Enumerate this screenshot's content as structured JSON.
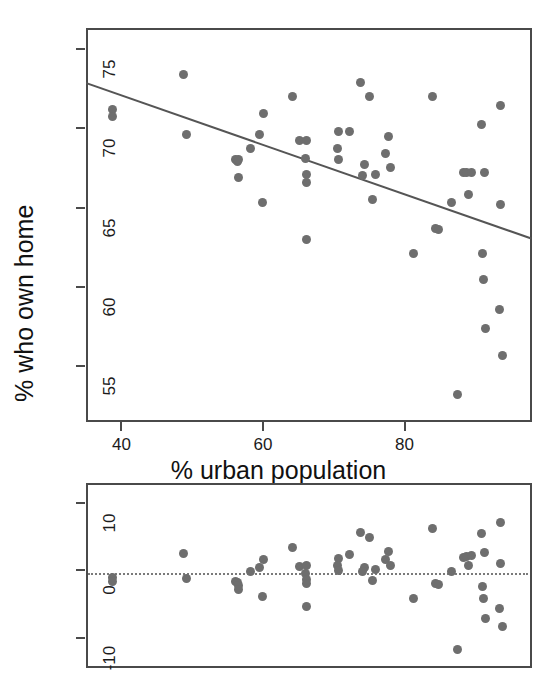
{
  "figure": {
    "width": 557,
    "height": 687,
    "background": "#ffffff",
    "point_color": "#6e6e6e",
    "line_color": "#555555",
    "frame_color": "#4a4a4a"
  },
  "chart_data": [
    {
      "type": "scatter",
      "id": "scatter-regression",
      "title": "",
      "xlabel": "% urban population",
      "ylabel": "% who own home",
      "xlim": [
        35.0,
        98.0
      ],
      "ylim": [
        51.5,
        76.3
      ],
      "xticks": [
        40,
        60,
        80
      ],
      "xticklabels": [
        "40",
        "60",
        "80"
      ],
      "yticks": [
        55,
        60,
        65,
        70,
        75
      ],
      "yticklabels": [
        "55",
        "60",
        "65",
        "70",
        "75"
      ],
      "grid": false,
      "legend": false,
      "fit_line": {
        "label": "least-squares regression line",
        "x_start": 35.0,
        "y_start": 72.9,
        "x_end": 98.0,
        "y_end": 63.1,
        "slope": -0.1556,
        "intercept": 78.35
      },
      "points": [
        {
          "x": 38.8,
          "y": 71.2
        },
        {
          "x": 38.8,
          "y": 70.7
        },
        {
          "x": 48.8,
          "y": 73.4
        },
        {
          "x": 49.2,
          "y": 69.6
        },
        {
          "x": 56.1,
          "y": 68.0
        },
        {
          "x": 56.4,
          "y": 67.9
        },
        {
          "x": 56.6,
          "y": 68.0
        },
        {
          "x": 56.5,
          "y": 66.9
        },
        {
          "x": 58.3,
          "y": 68.7
        },
        {
          "x": 59.5,
          "y": 69.6
        },
        {
          "x": 60.1,
          "y": 70.9
        },
        {
          "x": 60.0,
          "y": 65.3
        },
        {
          "x": 64.1,
          "y": 72.0
        },
        {
          "x": 65.1,
          "y": 69.2
        },
        {
          "x": 66.1,
          "y": 69.2
        },
        {
          "x": 66.0,
          "y": 68.1
        },
        {
          "x": 66.2,
          "y": 67.1
        },
        {
          "x": 66.1,
          "y": 66.6
        },
        {
          "x": 66.1,
          "y": 63.0
        },
        {
          "x": 70.6,
          "y": 69.8
        },
        {
          "x": 70.5,
          "y": 68.7
        },
        {
          "x": 70.7,
          "y": 68.0
        },
        {
          "x": 72.2,
          "y": 69.8
        },
        {
          "x": 73.8,
          "y": 72.9
        },
        {
          "x": 74.4,
          "y": 67.7
        },
        {
          "x": 74.0,
          "y": 67.0
        },
        {
          "x": 75.0,
          "y": 72.0
        },
        {
          "x": 75.5,
          "y": 65.5
        },
        {
          "x": 75.9,
          "y": 67.1
        },
        {
          "x": 77.7,
          "y": 69.5
        },
        {
          "x": 77.3,
          "y": 68.4
        },
        {
          "x": 78.0,
          "y": 67.5
        },
        {
          "x": 81.2,
          "y": 62.1
        },
        {
          "x": 84.0,
          "y": 72.0
        },
        {
          "x": 84.4,
          "y": 63.7
        },
        {
          "x": 84.8,
          "y": 63.6
        },
        {
          "x": 86.6,
          "y": 65.3
        },
        {
          "x": 87.5,
          "y": 53.2
        },
        {
          "x": 88.3,
          "y": 67.2
        },
        {
          "x": 88.7,
          "y": 67.2
        },
        {
          "x": 89.4,
          "y": 67.2
        },
        {
          "x": 89.0,
          "y": 65.8
        },
        {
          "x": 90.9,
          "y": 70.2
        },
        {
          "x": 91.3,
          "y": 67.2
        },
        {
          "x": 91.0,
          "y": 62.1
        },
        {
          "x": 91.2,
          "y": 60.5
        },
        {
          "x": 91.5,
          "y": 57.4
        },
        {
          "x": 93.5,
          "y": 71.4
        },
        {
          "x": 93.6,
          "y": 65.2
        },
        {
          "x": 93.4,
          "y": 58.6
        },
        {
          "x": 93.8,
          "y": 55.7
        }
      ]
    },
    {
      "type": "scatter",
      "id": "residual-plot",
      "title": "",
      "xlabel": "",
      "ylabel": "",
      "xlim": [
        35.0,
        98.0
      ],
      "ylim": [
        -14.5,
        13.0
      ],
      "xticks": [],
      "xticklabels": [],
      "yticks": [
        -10,
        0,
        10
      ],
      "yticklabels": [
        "-10",
        "0",
        "10"
      ],
      "grid": false,
      "legend": false,
      "reference_line": {
        "label": "zero residual line",
        "y": -0.4,
        "style": "dotted"
      },
      "points": [
        {
          "x": 38.8,
          "y": -1.1
        },
        {
          "x": 38.8,
          "y": -1.6
        },
        {
          "x": 48.8,
          "y": 2.5
        },
        {
          "x": 49.2,
          "y": -1.2
        },
        {
          "x": 56.1,
          "y": -1.6
        },
        {
          "x": 56.4,
          "y": -1.8
        },
        {
          "x": 56.6,
          "y": -2.2
        },
        {
          "x": 56.5,
          "y": -2.8
        },
        {
          "x": 58.3,
          "y": -0.2
        },
        {
          "x": 59.5,
          "y": 0.5
        },
        {
          "x": 60.1,
          "y": 1.6
        },
        {
          "x": 60.0,
          "y": -3.9
        },
        {
          "x": 64.1,
          "y": 3.4
        },
        {
          "x": 65.1,
          "y": 0.6
        },
        {
          "x": 66.1,
          "y": 0.7
        },
        {
          "x": 66.0,
          "y": -0.4
        },
        {
          "x": 66.2,
          "y": -1.4
        },
        {
          "x": 66.1,
          "y": -1.9
        },
        {
          "x": 66.1,
          "y": -5.4
        },
        {
          "x": 70.6,
          "y": 1.8
        },
        {
          "x": 70.5,
          "y": 0.7
        },
        {
          "x": 70.7,
          "y": 0.0
        },
        {
          "x": 72.2,
          "y": 2.3
        },
        {
          "x": 73.8,
          "y": 5.6
        },
        {
          "x": 74.4,
          "y": 0.5
        },
        {
          "x": 74.0,
          "y": -0.2
        },
        {
          "x": 75.0,
          "y": 4.9
        },
        {
          "x": 75.5,
          "y": -1.5
        },
        {
          "x": 75.9,
          "y": 0.1
        },
        {
          "x": 77.7,
          "y": 2.8
        },
        {
          "x": 77.3,
          "y": 1.6
        },
        {
          "x": 78.0,
          "y": 0.8
        },
        {
          "x": 81.2,
          "y": -4.1
        },
        {
          "x": 84.0,
          "y": 6.2
        },
        {
          "x": 84.4,
          "y": -2.0
        },
        {
          "x": 84.8,
          "y": -2.1
        },
        {
          "x": 86.6,
          "y": -0.1
        },
        {
          "x": 87.5,
          "y": -11.8
        },
        {
          "x": 88.3,
          "y": 2.0
        },
        {
          "x": 88.7,
          "y": 2.1
        },
        {
          "x": 89.4,
          "y": 2.2
        },
        {
          "x": 89.0,
          "y": 0.8
        },
        {
          "x": 90.9,
          "y": 5.5
        },
        {
          "x": 91.3,
          "y": 2.6
        },
        {
          "x": 91.0,
          "y": -2.4
        },
        {
          "x": 91.2,
          "y": -4.1
        },
        {
          "x": 91.5,
          "y": -7.1
        },
        {
          "x": 93.5,
          "y": 7.2
        },
        {
          "x": 93.6,
          "y": 1.1
        },
        {
          "x": 93.4,
          "y": -5.6
        },
        {
          "x": 93.8,
          "y": -8.4
        }
      ]
    }
  ]
}
